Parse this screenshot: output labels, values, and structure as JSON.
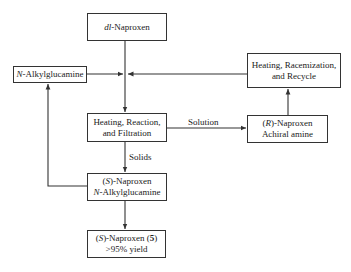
{
  "nodes": {
    "dl_naproxen": {
      "italic": "dl",
      "text": "-Naproxen"
    },
    "n_alkylglucamine": {
      "italic": "N",
      "text": "-Alkylglucamine"
    },
    "racemization": {
      "line1": "Heating, Racemization,",
      "line2": "and Recycle"
    },
    "reaction": {
      "line1": "Heating, Reaction,",
      "line2": "and Filtration"
    },
    "r_naproxen": {
      "line1_pre": "(",
      "line1_italic": "R",
      "line1_post": ")-Naproxen",
      "line2": "Achiral amine"
    },
    "s_salt": {
      "line1_pre": "(",
      "line1_italic": "S",
      "line1_post": ")-Naproxen",
      "line2_italic": "N",
      "line2_post": "-Alkylglucamine"
    },
    "s_product": {
      "line1_pre": "(",
      "line1_italic": "S",
      "line1_post": ")-Naproxen (",
      "line1_bold": "5",
      "line1_end": ")",
      "line2": ">95% yield"
    }
  },
  "edge_labels": {
    "solution": "Solution",
    "solids": "Solids"
  }
}
